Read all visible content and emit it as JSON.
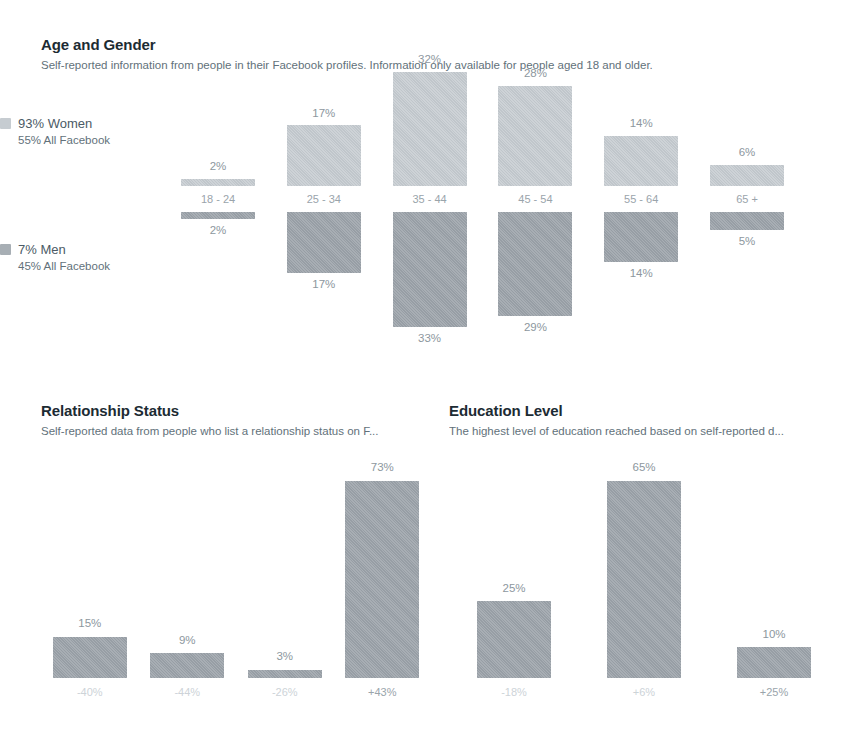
{
  "age_gender": {
    "title": "Age and Gender",
    "subtitle": "Self-reported information from people in their Facebook profiles. Information only available for people aged 18 and older.",
    "legend": {
      "women": {
        "swatch": "women-swatch",
        "main": "93% Women",
        "sub": "55% All Facebook"
      },
      "men": {
        "swatch": "men-swatch",
        "main": "7% Men",
        "sub": "45% All Facebook"
      }
    }
  },
  "relationship": {
    "title": "Relationship Status",
    "subtitle": "Self-reported data from people who list a relationship status on F..."
  },
  "education": {
    "title": "Education Level",
    "subtitle": "The highest level of education reached based on self-reported d..."
  },
  "colors": {
    "women_bar": "#c3c9ce",
    "men_bar": "#9aa1a8",
    "heading": "#1c2b33",
    "subtext": "#62717a",
    "value_label": "#8d979e",
    "axis_label": "#9aa4ab"
  },
  "chart_data": [
    {
      "type": "bar",
      "title": "Age and Gender",
      "subtitle": "Self-reported information from people in their Facebook profiles. Information only available for people aged 18 and older.",
      "xlabel": "",
      "ylabel": "",
      "grid": false,
      "legend_position": "left",
      "orientation": "diverging-vertical",
      "categories": [
        "18 - 24",
        "25 - 34",
        "35 - 44",
        "45 - 54",
        "55 - 64",
        "65 +"
      ],
      "series": [
        {
          "name": "93% Women",
          "sublabel": "55% All Facebook",
          "direction": "up",
          "color": "#c3c9ce",
          "values": [
            2,
            17,
            32,
            28,
            14,
            6
          ],
          "value_labels": [
            "2%",
            "17%",
            "32%",
            "28%",
            "14%",
            "6%"
          ]
        },
        {
          "name": "7% Men",
          "sublabel": "45% All Facebook",
          "direction": "down",
          "color": "#9aa1a8",
          "values": [
            2,
            17,
            33,
            29,
            14,
            5
          ],
          "value_labels": [
            "2%",
            "17%",
            "33%",
            "29%",
            "14%",
            "5%"
          ]
        }
      ],
      "ylim": [
        0,
        35
      ]
    },
    {
      "type": "bar",
      "title": "Relationship Status",
      "subtitle": "Self-reported data from people who list a relationship status on F...",
      "xlabel": "",
      "ylabel": "",
      "grid": false,
      "categories": [
        "-40%",
        "-44%",
        "-26%",
        "+43%"
      ],
      "values": [
        15,
        9,
        3,
        73
      ],
      "value_labels": [
        "15%",
        "9%",
        "3%",
        "73%"
      ],
      "ylim": [
        0,
        75
      ],
      "color": "#9aa1a8"
    },
    {
      "type": "bar",
      "title": "Education Level",
      "subtitle": "The highest level of education reached based on self-reported d...",
      "xlabel": "",
      "ylabel": "",
      "grid": false,
      "categories": [
        "-18%",
        "+6%",
        "+25%"
      ],
      "values": [
        25,
        65,
        10
      ],
      "value_labels": [
        "25%",
        "65%",
        "10%"
      ],
      "ylim": [
        0,
        70
      ],
      "color": "#9aa1a8"
    }
  ]
}
